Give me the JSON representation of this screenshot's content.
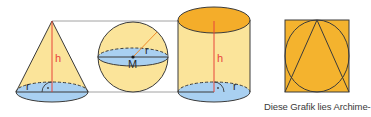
{
  "colors": {
    "yellow_fill": "#fbe49a",
    "orange_fill": "#f4ad2a",
    "blue_fill": "#a9d0f1",
    "outline": "#3b3b3b",
    "height_line": "#e8453a",
    "connector_line": "#8a8a8a"
  },
  "figures": {
    "cone": {
      "height_label": "h",
      "radius_label": "r",
      "right_angle_mark": "·"
    },
    "sphere": {
      "radius_label": "r",
      "center_label": "M"
    },
    "cylinder": {
      "height_label": "h",
      "radius_label": "r",
      "right_angle_mark": "·"
    },
    "square": {
      "description": "square with inscribed circle and triangle"
    }
  },
  "caption": "Diese Grafik lies Archime-"
}
